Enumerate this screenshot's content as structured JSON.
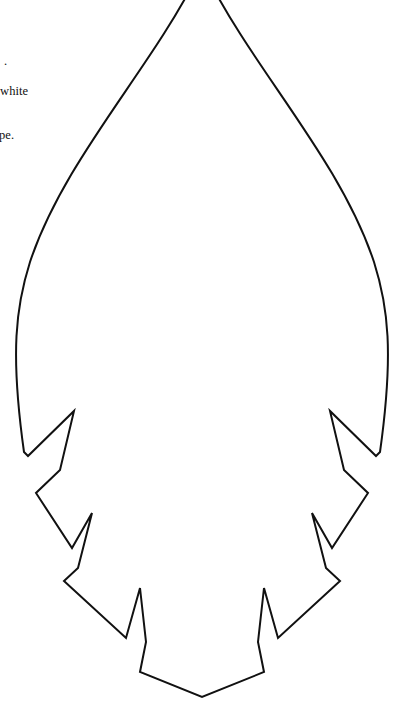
{
  "page": {
    "background_color": "#ffffff",
    "width": 393,
    "height": 720
  },
  "text_fragments": {
    "fragment_1": ".",
    "fragment_2": "white",
    "fragment_3": "pe."
  },
  "drawing": {
    "name": "leaf-outline-template",
    "description": "Line-art outline of an elongated barbed leaf / arrowhead shape",
    "stroke_color": "#111111",
    "fill_color": "#ffffff",
    "stroke_width": "2",
    "apex_clipped_at_top": "true",
    "outline_path": "M 196 -22 C 150 70, 64 160, 30 262 C 16 306, 10 352, 24 452 L 28 456 L 74 411 L 60 470 L 36 493 L 72 548 L 92 513 L 78 568 L 64 581 L 126 638 L 140 588 L 146 642 L 140 672 L 202 697 L 264 672 L 258 642 L 264 588 L 278 638 L 340 581 L 326 568 L 312 513 L 332 548 L 368 493 L 344 470 L 330 411 L 376 456 L 380 452 C 394 352, 388 306, 374 262 C 340 160, 254 70, 208 -22 Z"
  }
}
